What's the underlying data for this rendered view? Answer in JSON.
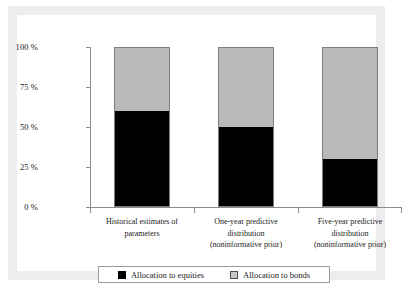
{
  "chart_data": {
    "type": "bar",
    "subtype": "stacked-100-percent",
    "title": "",
    "xlabel": "",
    "ylabel": "",
    "ylim": [
      0,
      100
    ],
    "yticks": [
      0,
      25,
      50,
      75,
      100
    ],
    "ytick_labels": [
      "0 %",
      "25 %",
      "50 %",
      "75 %",
      "100 %"
    ],
    "grid": false,
    "legend_position": "bottom",
    "categories": [
      "Historical estimates of parameters",
      "One-year predictive distribution (noninformative prior)",
      "Five-year predictive distribution (noninformative prior)"
    ],
    "category_lines": [
      [
        "Historical estimates of",
        "parameters"
      ],
      [
        "One-year predictive",
        "distribution",
        "(noninformative prior)"
      ],
      [
        "Five-year predictive",
        "distribution",
        "(noninformative prior)"
      ]
    ],
    "series": [
      {
        "name": "Allocation to equities",
        "color": "#000000",
        "values": [
          60,
          50,
          30
        ]
      },
      {
        "name": "Allocation to bonds",
        "color": "#b9b9b9",
        "values": [
          40,
          50,
          70
        ]
      }
    ]
  },
  "axis": {
    "tick_100": "100 %",
    "tick_75": "75 %",
    "tick_50": "50 %",
    "tick_25": "25 %",
    "tick_0": "0 %"
  },
  "categories": {
    "cat0_line0": "Historical estimates of",
    "cat0_line1": "parameters",
    "cat0_line2": "",
    "cat1_line0": "One-year predictive",
    "cat1_line1": "distribution",
    "cat1_line2": "(noninformative prior)",
    "cat2_line0": "Five-year predictive",
    "cat2_line1": "distribution",
    "cat2_line2": "(noninformative prior)"
  },
  "legend": {
    "equities_label": "Allocation to equities",
    "bonds_label": "Allocation to bonds"
  },
  "colors": {
    "equities": "#000000",
    "bonds": "#b9b9b9",
    "axis": "#8c8c8c",
    "frame": "#ededed",
    "bar_border": "#7d7d7d"
  }
}
